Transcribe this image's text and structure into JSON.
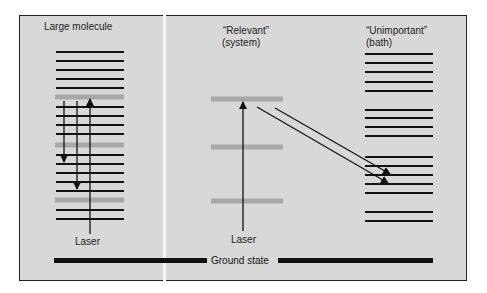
{
  "diagram": {
    "title_left": "Large molecule",
    "title_middle_line1": "“Relevant”",
    "title_middle_line2": "(system)",
    "title_right_line1": "“Unimportant”",
    "title_right_line2": "(bath)",
    "laser_left": "Laser",
    "laser_middle": "Laser",
    "ground_state": "Ground state",
    "colors": {
      "background": "#d8d8d8",
      "level_black": "#111111",
      "level_gray": "#a8a8a8",
      "frame": "#222222",
      "separator": "#f4f4f4"
    },
    "left_levels": [
      {
        "y": 52,
        "type": "black"
      },
      {
        "y": 61,
        "type": "black"
      },
      {
        "y": 70,
        "type": "black"
      },
      {
        "y": 79,
        "type": "black"
      },
      {
        "y": 88,
        "type": "black"
      },
      {
        "y": 97,
        "type": "gray"
      },
      {
        "y": 107,
        "type": "black"
      },
      {
        "y": 116,
        "type": "black"
      },
      {
        "y": 125,
        "type": "black"
      },
      {
        "y": 134,
        "type": "black"
      },
      {
        "y": 145,
        "type": "gray"
      },
      {
        "y": 155,
        "type": "black"
      },
      {
        "y": 164,
        "type": "black"
      },
      {
        "y": 173,
        "type": "black"
      },
      {
        "y": 182,
        "type": "black"
      },
      {
        "y": 191,
        "type": "black"
      },
      {
        "y": 200,
        "type": "gray"
      },
      {
        "y": 210,
        "type": "black"
      },
      {
        "y": 219,
        "type": "black"
      }
    ],
    "middle_levels": [
      99,
      147,
      201
    ],
    "right_levels": [
      54,
      63,
      72,
      82,
      91,
      110,
      118,
      127,
      136,
      157,
      166,
      175,
      184,
      193,
      212,
      221
    ]
  }
}
